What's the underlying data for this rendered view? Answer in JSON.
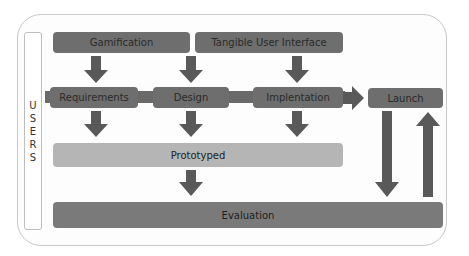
{
  "side_label": {
    "text": "USERS",
    "letters": [
      "U",
      "S",
      "E",
      "R",
      "S"
    ]
  },
  "inputs": [
    {
      "label": "Gamification"
    },
    {
      "label": "Tangible User Interface"
    }
  ],
  "stages": [
    {
      "label": "Requirements"
    },
    {
      "label": "Design"
    },
    {
      "label": "Implentation"
    },
    {
      "label": "Launch"
    }
  ],
  "prototype": {
    "label": "Prototyped"
  },
  "evaluation": {
    "label": "Evaluation"
  },
  "colors": {
    "box_dark": "#6e6e6e",
    "box_light": "#b5b5b5",
    "arrow": "#595959",
    "frame_border": "#c9c9c9"
  }
}
